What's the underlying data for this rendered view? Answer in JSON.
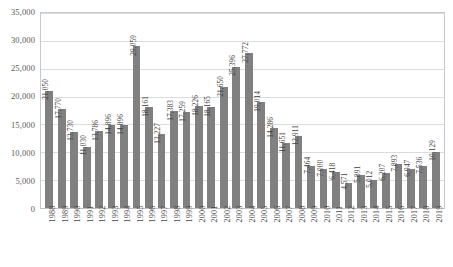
{
  "chart_data": {
    "type": "bar",
    "title": "",
    "subtitle": "",
    "xlabel": "",
    "ylabel": "",
    "ylim": [
      0,
      35000
    ],
    "grid": true,
    "legend": false,
    "legend_position": "none",
    "bar_color": "#808080",
    "gridline_color": "#dcdcdc",
    "border_color": "#c8c8c8",
    "label_color": "#3f3f3f",
    "y_ticks": [
      "0",
      "5,000",
      "10,000",
      "15,000",
      "20,000",
      "25,000",
      "30,000",
      "35,000"
    ],
    "y_tick_values": [
      0,
      5000,
      10000,
      15000,
      20000,
      25000,
      30000,
      35000
    ],
    "categories": [
      "1988",
      "1989",
      "1990",
      "1991",
      "1992",
      "1993",
      "1994",
      "1995",
      "1996",
      "1997",
      "1998",
      "1999",
      "2000",
      "2001",
      "2002",
      "2003",
      "2004",
      "2005",
      "2006",
      "2007",
      "2008",
      "2009",
      "2010",
      "2011",
      "2012",
      "2013",
      "2014",
      "2015",
      "2016",
      "2017",
      "2018",
      "2019"
    ],
    "values": [
      21050,
      17770,
      13730,
      11030,
      13786,
      14896,
      14896,
      29059,
      18161,
      13227,
      17383,
      17259,
      18226,
      18165,
      21650,
      25396,
      27772,
      19014,
      14286,
      11651,
      12911,
      7464,
      7000,
      6418,
      4571,
      5891,
      5012,
      6207,
      7893,
      6947,
      7536,
      10129
    ],
    "data_labels": [
      "21,050",
      "17,770",
      "13,730",
      "11,030",
      "13,786",
      "14,896",
      "14,896",
      "29,059",
      "18,161",
      "13,227",
      "17,383",
      "17,259",
      "18,226",
      "18,165",
      "21,650",
      "25,396",
      "27,772",
      "19,014",
      "14,286",
      "11,651",
      "12,911",
      "7,464",
      "7,000",
      "6,418",
      "4,571",
      "5,891",
      "5,012",
      "6,207",
      "7,893",
      "6,947",
      "7,536",
      "10,129"
    ]
  }
}
